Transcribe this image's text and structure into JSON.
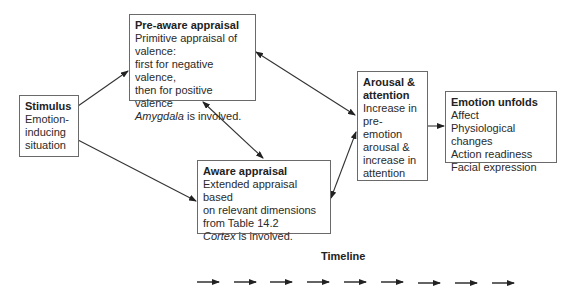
{
  "nodes": {
    "stimulus": {
      "title": "Stimulus",
      "lines": [
        "Emotion-",
        "inducing",
        "situation"
      ]
    },
    "pre_aware": {
      "title": "Pre-aware appraisal",
      "lines": [
        "Primitive appraisal of",
        "valence:",
        "first for negative valence,",
        "then for positive valence"
      ],
      "note_italic": "Amygdala",
      "note_rest": " is involved."
    },
    "aware": {
      "title": "Aware appraisal",
      "lines": [
        "Extended appraisal based",
        "on relevant dimensions",
        "from Table 14.2"
      ],
      "note_italic": "Cortex",
      "note_rest": " is involved."
    },
    "arousal": {
      "title_lines": [
        "Arousal &",
        "attention"
      ],
      "lines": [
        "Increase in",
        "pre-",
        "emotion",
        "arousal &",
        "increase in",
        "attention"
      ]
    },
    "emotion": {
      "title": "Emotion unfolds",
      "lines": [
        "Affect",
        "Physiological changes",
        "Action readiness",
        "Facial expression"
      ]
    }
  },
  "edges": [
    {
      "from": "stimulus",
      "to": "pre_aware",
      "type": "directed"
    },
    {
      "from": "stimulus",
      "to": "aware",
      "type": "directed"
    },
    {
      "from": "pre_aware",
      "to": "aware",
      "type": "bidirectional"
    },
    {
      "from": "arousal",
      "to": "pre_aware",
      "type": "bidirectional"
    },
    {
      "from": "arousal",
      "to": "aware",
      "type": "bidirectional"
    },
    {
      "from": "arousal",
      "to": "emotion",
      "type": "directed"
    }
  ],
  "timeline": {
    "label": "Timeline",
    "arrow_count": 9
  }
}
